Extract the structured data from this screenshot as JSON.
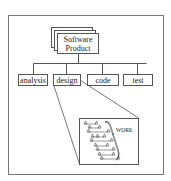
{
  "diagram": {
    "root": {
      "line1": "Software",
      "line2": "Product"
    },
    "children": [
      {
        "id": "analysis",
        "label": "analysis"
      },
      {
        "id": "design",
        "label": "design"
      },
      {
        "id": "code",
        "label": "code"
      },
      {
        "id": "test",
        "label": "test"
      }
    ],
    "detail": {
      "label": "WORK",
      "expanded_from": "design"
    },
    "colors": {
      "stroke": "#555555",
      "text": "#222222",
      "background": "#ffffff"
    }
  }
}
